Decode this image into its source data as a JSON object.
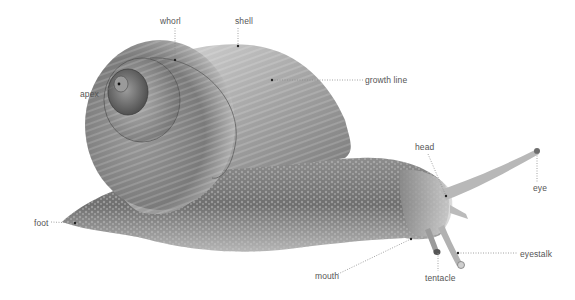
{
  "diagram": {
    "labels": [
      {
        "id": "whorl",
        "text": "whorl",
        "x": 160,
        "y": 16,
        "point": [
          175,
          60
        ]
      },
      {
        "id": "shell",
        "text": "shell",
        "x": 235,
        "y": 16,
        "point": [
          238,
          46
        ]
      },
      {
        "id": "apex",
        "text": "apex",
        "x": 80,
        "y": 89,
        "point": [
          119,
          84
        ]
      },
      {
        "id": "growth-line",
        "text": "growth line",
        "x": 365,
        "y": 75,
        "point": [
          272,
          80
        ]
      },
      {
        "id": "head",
        "text": "head",
        "x": 415,
        "y": 142,
        "point": [
          446,
          196
        ]
      },
      {
        "id": "eye",
        "text": "eye",
        "x": 533,
        "y": 183,
        "point": [
          537,
          150
        ]
      },
      {
        "id": "foot",
        "text": "foot",
        "x": 34,
        "y": 218,
        "point": [
          75,
          223
        ]
      },
      {
        "id": "mouth",
        "text": "mouth",
        "x": 315,
        "y": 271,
        "point": [
          411,
          239
        ]
      },
      {
        "id": "tentacle",
        "text": "tentacle",
        "x": 425,
        "y": 273,
        "point": [
          438,
          252
        ]
      },
      {
        "id": "eyestalk",
        "text": "eyestalk",
        "x": 520,
        "y": 249,
        "point": [
          458,
          253
        ]
      }
    ],
    "colors": {
      "label_text": "#555555",
      "leader_line": "#888888",
      "background": "#ffffff"
    }
  }
}
